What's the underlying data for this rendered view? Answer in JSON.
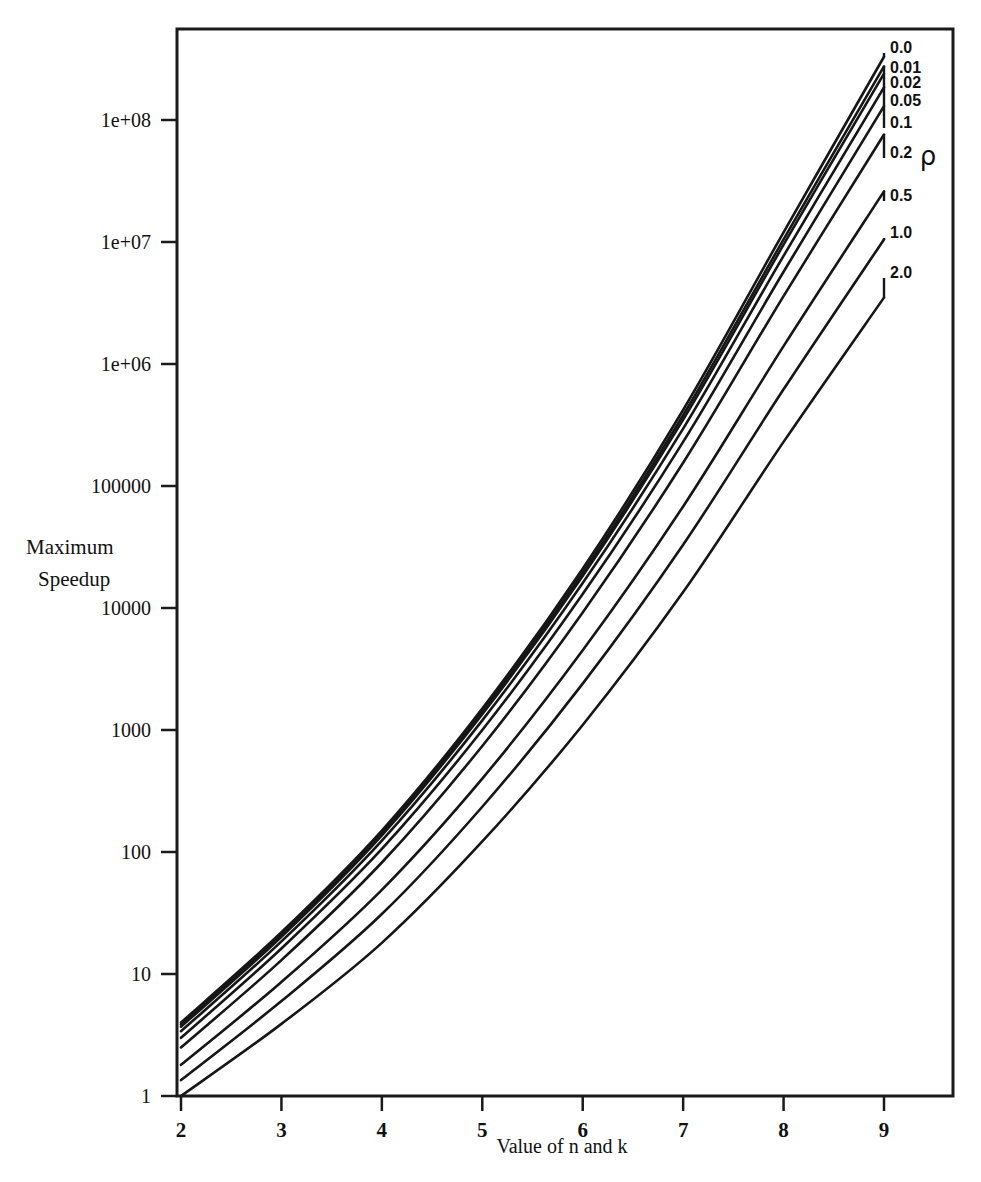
{
  "chart_data": {
    "type": "line",
    "title": "",
    "xlabel": "Value of n and k",
    "ylabel": "Maximum Speedup",
    "ylabel_line1": "Maximum",
    "ylabel_line2": "Speedup",
    "legend_title": "ρ",
    "legend_position": "right-inline-curve-labels",
    "grid": false,
    "yscale": "log",
    "xscale": "linear",
    "xlim": [
      1.72,
      9.7
    ],
    "ylim": [
      1,
      400000000
    ],
    "xticks": [
      "2",
      "3",
      "4",
      "5",
      "6",
      "7",
      "8",
      "9"
    ],
    "xtick_values": [
      2,
      3,
      4,
      5,
      6,
      7,
      8,
      9
    ],
    "yticks": [
      "1",
      "10",
      "100",
      "1000",
      "10000",
      "100000",
      "1e+06",
      "1e+07",
      "1e+08"
    ],
    "ytick_values": [
      1,
      10,
      100,
      1000,
      10000,
      100000,
      1000000,
      10000000,
      100000000
    ],
    "x": [
      2,
      3,
      4,
      5,
      6,
      7,
      8,
      9
    ],
    "series": [
      {
        "name": "0.0",
        "label": "0.0",
        "values": [
          4.0,
          22.0,
          150.0,
          1500.0,
          21000.0,
          420000.0,
          12000000.0,
          330000000.0
        ]
      },
      {
        "name": "0.01",
        "label": "0.01",
        "values": [
          3.85,
          21.0,
          143.0,
          1420.0,
          19500.0,
          380000.0,
          10500000.0,
          275000000.0
        ]
      },
      {
        "name": "0.02",
        "label": "0.02",
        "values": [
          3.7,
          20.2,
          137.0,
          1350.0,
          18300.0,
          350000.0,
          9500000.0,
          240000000.0
        ]
      },
      {
        "name": "0.05",
        "label": "0.05",
        "values": [
          3.4,
          18.5,
          124.0,
          1200.0,
          16000.0,
          295000.0,
          7700000.0,
          185000000.0
        ]
      },
      {
        "name": "0.1",
        "label": "0.1",
        "values": [
          3.0,
          16.2,
          106.0,
          1000.0,
          13000.0,
          230000.0,
          5700000.0,
          130000000.0
        ]
      },
      {
        "name": "0.2",
        "label": "0.2",
        "values": [
          2.5,
          13.0,
          82.0,
          740.0,
          9200.0,
          155000.0,
          3600000.0,
          76000000.0
        ]
      },
      {
        "name": "0.5",
        "label": "0.5",
        "values": [
          1.8,
          8.6,
          49.0,
          400.0,
          4500.0,
          68000.0,
          1400000.0,
          26000000.0
        ]
      },
      {
        "name": "1.0",
        "label": "1.0",
        "values": [
          1.35,
          6.0,
          31.0,
          235.0,
          2400.0,
          33000.0,
          620000.0,
          10500000.0
        ]
      },
      {
        "name": "2.0",
        "label": "2.0",
        "values": [
          1.0,
          3.9,
          18.0,
          122.0,
          1100.0,
          13500.0,
          230000.0,
          3500000.0
        ]
      }
    ]
  },
  "axis": {
    "x_title": "Value of n and k",
    "y_title_line1": "Maximum",
    "y_title_line2": "Speedup"
  },
  "legend": {
    "symbol": "ρ",
    "entries": [
      "0.0",
      "0.01",
      "0.02",
      "0.05",
      "0.1",
      "0.2",
      "0.5",
      "1.0",
      "2.0"
    ]
  },
  "colors": {
    "line": "#161616",
    "axis": "#1a1a1a",
    "background": "#ffffff"
  }
}
